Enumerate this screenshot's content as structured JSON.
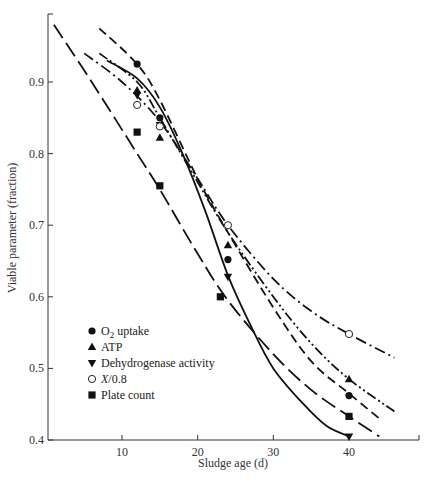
{
  "chart_data": {
    "type": "line",
    "title": "",
    "xlabel": "Sludge age (d)",
    "ylabel": "Viable parameter (fraction)",
    "xlim": [
      0,
      48
    ],
    "ylim": [
      0.4,
      0.99
    ],
    "x_ticks": [
      10,
      20,
      30,
      40
    ],
    "y_ticks": [
      0.4,
      0.5,
      0.6,
      0.7,
      0.8,
      0.9
    ],
    "grid": false,
    "legend_position": "lower left",
    "series": [
      {
        "name": "O2 uptake",
        "marker": "filled-circle",
        "line_style": "medium-dash",
        "points": [
          [
            12,
            0.925
          ],
          [
            15,
            0.85
          ],
          [
            24,
            0.652
          ],
          [
            40,
            0.462
          ]
        ],
        "curve": [
          [
            7,
            0.975
          ],
          [
            12,
            0.925
          ],
          [
            15,
            0.875
          ],
          [
            20,
            0.765
          ],
          [
            24,
            0.69
          ],
          [
            30,
            0.585
          ],
          [
            35,
            0.51
          ],
          [
            40,
            0.465
          ],
          [
            44,
            0.43
          ]
        ]
      },
      {
        "name": "ATP",
        "marker": "filled-triangle-up",
        "line_style": "dash-dot-dot",
        "points": [
          [
            12,
            0.888
          ],
          [
            15,
            0.822
          ],
          [
            24,
            0.672
          ],
          [
            40,
            0.485
          ]
        ],
        "curve": [
          [
            7,
            0.94
          ],
          [
            12,
            0.9
          ],
          [
            15,
            0.85
          ],
          [
            20,
            0.76
          ],
          [
            24,
            0.69
          ],
          [
            30,
            0.6
          ],
          [
            35,
            0.535
          ],
          [
            40,
            0.485
          ],
          [
            46,
            0.44
          ]
        ]
      },
      {
        "name": "Dehydrogenase activity",
        "marker": "filled-triangle-down",
        "line_style": "solid",
        "points": [
          [
            12,
            0.882
          ],
          [
            15,
            0.84
          ],
          [
            24,
            0.628
          ],
          [
            40,
            0.405
          ]
        ],
        "curve": [
          [
            8,
            0.93
          ],
          [
            12,
            0.905
          ],
          [
            15,
            0.865
          ],
          [
            18,
            0.8
          ],
          [
            21,
            0.72
          ],
          [
            24,
            0.63
          ],
          [
            27,
            0.56
          ],
          [
            30,
            0.5
          ],
          [
            34,
            0.45
          ],
          [
            37,
            0.42
          ],
          [
            40,
            0.405
          ]
        ]
      },
      {
        "name": "X/0.8",
        "marker": "open-circle",
        "line_style": "dash-dot",
        "points": [
          [
            12,
            0.868
          ],
          [
            15,
            0.838
          ],
          [
            24,
            0.7
          ],
          [
            40,
            0.548
          ]
        ],
        "curve": [
          [
            5,
            0.94
          ],
          [
            10,
            0.9
          ],
          [
            15,
            0.845
          ],
          [
            20,
            0.765
          ],
          [
            24,
            0.7
          ],
          [
            30,
            0.625
          ],
          [
            35,
            0.58
          ],
          [
            40,
            0.548
          ],
          [
            46,
            0.515
          ]
        ]
      },
      {
        "name": "Plate count",
        "marker": "filled-square",
        "line_style": "long-dash",
        "points": [
          [
            12,
            0.83
          ],
          [
            15,
            0.755
          ],
          [
            23,
            0.6
          ],
          [
            40,
            0.433
          ]
        ],
        "curve": [
          [
            1,
            0.98
          ],
          [
            6,
            0.9
          ],
          [
            12,
            0.8
          ],
          [
            15,
            0.75
          ],
          [
            20,
            0.66
          ],
          [
            24,
            0.595
          ],
          [
            30,
            0.52
          ],
          [
            35,
            0.47
          ],
          [
            40,
            0.433
          ],
          [
            44,
            0.405
          ]
        ]
      }
    ]
  },
  "legend": {
    "items": [
      {
        "marker": "filled-circle",
        "label_main": "O",
        "label_sub": "2",
        "label_rest": " uptake"
      },
      {
        "marker": "filled-triangle-up",
        "label": "ATP"
      },
      {
        "marker": "filled-triangle-down",
        "label": "Dehydrogenase activity"
      },
      {
        "marker": "open-circle",
        "label_italic": "X",
        "label_rest": "/0.8"
      },
      {
        "marker": "filled-square",
        "label": "Plate count"
      }
    ]
  },
  "axes": {
    "x_title": "Sludge age (d)",
    "y_title": "Viable parameter (fraction)",
    "x_tick_labels": [
      "10",
      "20",
      "30",
      "40"
    ],
    "y_tick_labels": [
      "0.4",
      "0.5",
      "0.6",
      "0.7",
      "0.8",
      "0.9"
    ]
  }
}
